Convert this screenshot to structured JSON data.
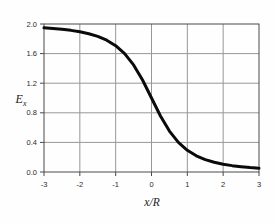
{
  "labels": {
    "ylabel_base": "E",
    "ylabel_sub": "x",
    "xlabel": "x/R"
  },
  "style": {
    "background": "#fefefe",
    "curve_color": "#0a0a0a",
    "grid_color": "#979797",
    "frame_color": "#4a4a4a",
    "tick_color": "#4a4a4a",
    "label_color": "#1a1a1a"
  },
  "chart_data": {
    "type": "line",
    "title": "",
    "xlabel": "x/R",
    "ylabel": "E_x",
    "xlim": [
      -3,
      3
    ],
    "ylim": [
      0,
      2
    ],
    "xticks": [
      -3,
      -2,
      -1,
      0,
      1,
      2,
      3
    ],
    "xtick_labels": [
      "-3",
      "-2",
      "-1",
      "0",
      "1",
      "2",
      "3"
    ],
    "yticks": [
      0,
      0.4,
      0.8,
      1.2,
      1.6,
      2.0
    ],
    "ytick_labels": [
      "0.0",
      "0.4",
      "0.8",
      "1.2",
      "1.6",
      "2.0"
    ],
    "grid": true,
    "legend": false,
    "series": [
      {
        "name": "E_x",
        "x": [
          -3,
          -2.75,
          -2.5,
          -2.25,
          -2,
          -1.75,
          -1.5,
          -1.25,
          -1,
          -0.75,
          -0.5,
          -0.25,
          0,
          0.25,
          0.5,
          0.75,
          1,
          1.25,
          1.5,
          1.75,
          2,
          2.25,
          2.5,
          2.75,
          3
        ],
        "y": [
          1.949,
          1.94,
          1.928,
          1.914,
          1.894,
          1.868,
          1.832,
          1.781,
          1.707,
          1.6,
          1.447,
          1.243,
          1.0,
          0.757,
          0.553,
          0.4,
          0.293,
          0.219,
          0.168,
          0.132,
          0.106,
          0.086,
          0.072,
          0.06,
          0.051
        ]
      }
    ],
    "plot_area_px": {
      "left": 44,
      "right": 259,
      "top": 24,
      "bottom": 172
    }
  }
}
